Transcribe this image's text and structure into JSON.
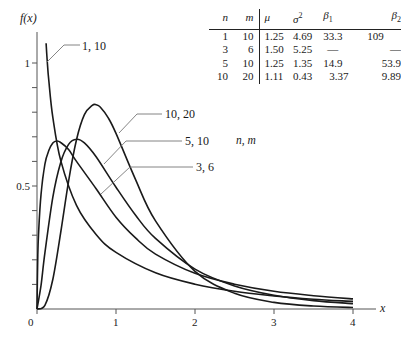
{
  "chart_data": {
    "type": "line",
    "title": "",
    "xlabel": "x",
    "ylabel": "f(x)",
    "xlim": [
      0,
      4
    ],
    "ylim": [
      0,
      1.0
    ],
    "grid": false,
    "x_ticks": [
      {
        "value": 0,
        "label": "0"
      },
      {
        "value": 1,
        "label": "1"
      },
      {
        "value": 2,
        "label": "2"
      },
      {
        "value": 3,
        "label": "3"
      },
      {
        "value": 4,
        "label": "4"
      }
    ],
    "y_ticks": [
      {
        "value": 0.1,
        "label": ""
      },
      {
        "value": 0.2,
        "label": ""
      },
      {
        "value": 0.3,
        "label": ""
      },
      {
        "value": 0.4,
        "label": ""
      },
      {
        "value": 0.5,
        "label": "0.5"
      },
      {
        "value": 0.6,
        "label": ""
      },
      {
        "value": 0.7,
        "label": ""
      },
      {
        "value": 0.8,
        "label": ""
      },
      {
        "value": 0.9,
        "label": ""
      },
      {
        "value": 1.0,
        "label": "1"
      }
    ],
    "legend_title": "n, m",
    "series": [
      {
        "name": "1, 10",
        "x": [
          0.115,
          0.13,
          0.15,
          0.2,
          0.3,
          0.5,
          0.75,
          1.0,
          1.5,
          2.0,
          2.5,
          3.0,
          3.5,
          4.0
        ],
        "y": [
          1.08,
          1.005,
          0.925,
          0.78,
          0.604,
          0.421,
          0.302,
          0.23,
          0.147,
          0.101,
          0.072,
          0.053,
          0.04,
          0.031
        ]
      },
      {
        "name": "3, 6",
        "x": [
          0.0,
          0.01,
          0.02,
          0.05,
          0.1,
          0.15,
          0.2,
          0.25,
          0.3,
          0.4,
          0.5,
          0.75,
          1.0,
          1.25,
          1.5,
          2.0,
          2.5,
          3.0,
          3.5,
          4.0
        ],
        "y": [
          0.0,
          0.22,
          0.31,
          0.464,
          0.589,
          0.645,
          0.675,
          0.683,
          0.677,
          0.648,
          0.6,
          0.488,
          0.373,
          0.288,
          0.223,
          0.145,
          0.101,
          0.072,
          0.054,
          0.041
        ]
      },
      {
        "name": "5, 10",
        "x": [
          0.0,
          0.05,
          0.1,
          0.2,
          0.3,
          0.4,
          0.5,
          0.6,
          0.75,
          1.0,
          1.25,
          1.5,
          2.0,
          2.5,
          3.0,
          3.5,
          4.0
        ],
        "y": [
          0.0,
          0.095,
          0.228,
          0.454,
          0.596,
          0.669,
          0.69,
          0.675,
          0.618,
          0.495,
          0.38,
          0.287,
          0.162,
          0.094,
          0.056,
          0.034,
          0.022
        ]
      },
      {
        "name": "10, 20",
        "x": [
          0.0,
          0.1,
          0.2,
          0.3,
          0.4,
          0.5,
          0.6,
          0.7,
          0.75,
          0.8,
          0.9,
          1.0,
          1.25,
          1.5,
          2.0,
          2.5,
          3.0,
          3.5,
          4.0
        ],
        "y": [
          0.0,
          0.015,
          0.12,
          0.311,
          0.52,
          0.688,
          0.79,
          0.828,
          0.83,
          0.821,
          0.778,
          0.714,
          0.524,
          0.358,
          0.153,
          0.064,
          0.027,
          0.012,
          0.006
        ]
      }
    ],
    "annotations": [
      {
        "text": "1, 10",
        "series": "1, 10"
      },
      {
        "text": "10, 20",
        "series": "10, 20"
      },
      {
        "text": "5, 10",
        "series": "5, 10"
      },
      {
        "text": "3, 6",
        "series": "3, 6"
      },
      {
        "text": "n, m",
        "role": "legend-title"
      }
    ],
    "moments_table": {
      "columns": [
        "n",
        "m",
        "μ",
        "σ²",
        "β₁",
        "β₂"
      ],
      "rows": [
        [
          "1",
          "10",
          "1.25",
          "4.69",
          "33.3",
          "109"
        ],
        [
          "3",
          "6",
          "1.50",
          "5.25",
          "—",
          "—"
        ],
        [
          "5",
          "10",
          "1.25",
          "1.35",
          "14.9",
          "53.9"
        ],
        [
          "10",
          "20",
          "1.11",
          "0.43",
          "3.37",
          "9.89"
        ]
      ]
    }
  },
  "labels": {
    "y_axis": "f(x)",
    "x_axis": "x",
    "legend_title": "n, m",
    "curve_1_10": "1, 10",
    "curve_10_20": "10, 20",
    "curve_5_10": "5, 10",
    "curve_3_6": "3, 6"
  },
  "table": {
    "headers": {
      "n": "n",
      "m": "m",
      "mu": "μ",
      "sigma2": "σ",
      "sigma2_sup": "2",
      "beta1": "β",
      "beta1_sub": "1",
      "beta2": "β",
      "beta2_sub": "2"
    },
    "rows": [
      {
        "n": "1",
        "m": "10",
        "mu": "1.25",
        "s2": "4.69",
        "b1": "33.3",
        "b2": "109"
      },
      {
        "n": "3",
        "m": "6",
        "mu": "1.50",
        "s2": "5.25",
        "b1": "—",
        "b2": "—"
      },
      {
        "n": "5",
        "m": "10",
        "mu": "1.25",
        "s2": "1.35",
        "b1": "14.9",
        "b2": "53.9"
      },
      {
        "n": "10",
        "m": "20",
        "mu": "1.11",
        "s2": "0.43",
        "b1": "3.37",
        "b2": "9.89"
      }
    ]
  },
  "style": {
    "curve_color": "#1a1a1a",
    "axis_color": "#555555",
    "leader_color": "#777777"
  }
}
